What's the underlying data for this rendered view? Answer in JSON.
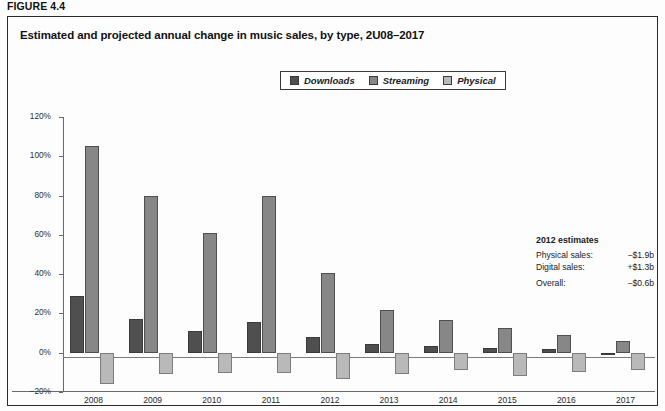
{
  "figure": {
    "number_label": "FIGURE 4.4",
    "title": "Estimated and projected annual change in music sales, by type, 2U08–2017"
  },
  "legend": {
    "items": [
      {
        "label": "Downloads",
        "color": "#4f4f4f",
        "icon": "legend-swatch-downloads"
      },
      {
        "label": "Streaming",
        "color": "#878787",
        "icon": "legend-swatch-streaming"
      },
      {
        "label": "Physical",
        "color": "#b9b9b9",
        "icon": "legend-swatch-physical"
      }
    ]
  },
  "annotation": {
    "title": "2012 estimates",
    "rows": [
      {
        "key": "Physical sales:",
        "value": "−$1.9b"
      },
      {
        "key": "Digital sales:",
        "value": "+$1.3b"
      },
      {
        "key": "Overall:",
        "value": "−$0.6b"
      }
    ]
  },
  "axis": {
    "y_ticks": [
      "120%",
      "100%",
      "80%",
      "60%",
      "40%",
      "20%",
      "0%",
      "−20%"
    ],
    "x_ticks": [
      "2008",
      "2009",
      "2010",
      "2011",
      "2012",
      "2013",
      "2014",
      "2015",
      "2016",
      "2017"
    ]
  },
  "chart_data": {
    "type": "bar",
    "title": "Estimated and projected annual change in music sales, by type, 2U08–2017",
    "xlabel": "",
    "ylabel": "",
    "ylim": [
      -20,
      120
    ],
    "ytick_step": 20,
    "grid": false,
    "legend_position": "top-center",
    "units": "percent annual change",
    "categories": [
      "2008",
      "2009",
      "2010",
      "2011",
      "2012",
      "2013",
      "2014",
      "2015",
      "2016",
      "2017"
    ],
    "series": [
      {
        "name": "Downloads",
        "color": "#4f4f4f",
        "values": [
          29,
          17,
          11,
          15.5,
          8,
          4.5,
          3.5,
          2.5,
          2,
          -1
        ]
      },
      {
        "name": "Streaming",
        "color": "#878787",
        "values": [
          105,
          80,
          61,
          80,
          40.5,
          22,
          16.5,
          12.5,
          9,
          6
        ]
      },
      {
        "name": "Physical",
        "color": "#b9b9b9",
        "values": [
          -16,
          -11,
          -10.5,
          -10.5,
          -13.5,
          -11,
          -9,
          -12,
          -10,
          -9
        ]
      }
    ],
    "annotations": [
      {
        "text": "2012 estimates",
        "role": "heading"
      },
      {
        "text": "Physical sales: −$1.9b",
        "role": "note"
      },
      {
        "text": "Digital sales: +$1.3b",
        "role": "note"
      },
      {
        "text": "Overall: −$0.6b",
        "role": "note"
      }
    ]
  }
}
